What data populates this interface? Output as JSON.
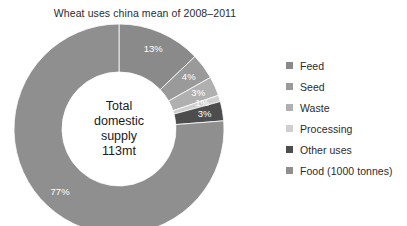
{
  "chart_data": {
    "type": "pie",
    "variant": "donut",
    "title": "Wheat uses china mean of 2008–2011",
    "categories": [
      "Feed",
      "Seed",
      "Waste",
      "Processing",
      "Other uses",
      "Food (1000 tonnes)"
    ],
    "values": [
      13,
      4,
      3,
      1,
      3,
      77
    ],
    "value_labels": [
      "13%",
      "4%",
      "3%",
      "1%",
      "3%",
      "77%"
    ],
    "unit": "%",
    "colors": [
      "#8a8a8a",
      "#9a9a9a",
      "#b0b0b0",
      "#cfcfcf",
      "#4d4d4d",
      "#8f8f8f"
    ],
    "legend_position": "right",
    "grid": false,
    "xlabel": "",
    "ylabel": "",
    "start_angle_deg": 0,
    "direction": "clockwise",
    "center_annotation": {
      "line1": "Total",
      "line2": "domestic",
      "line3": "supply",
      "line4": "113mt"
    }
  },
  "legend": {
    "items": [
      {
        "label": "Feed",
        "color": "#8a8a8a"
      },
      {
        "label": "Seed",
        "color": "#9a9a9a"
      },
      {
        "label": "Waste",
        "color": "#b0b0b0"
      },
      {
        "label": "Processing",
        "color": "#cfcfcf"
      },
      {
        "label": "Other uses",
        "color": "#4d4d4d"
      },
      {
        "label": "Food (1000 tonnes)",
        "color": "#8f8f8f"
      }
    ]
  }
}
